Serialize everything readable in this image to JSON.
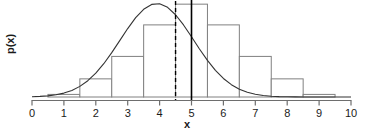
{
  "chart_data": {
    "type": "bar",
    "title": "",
    "subtitle": "",
    "xlabel": "x",
    "ylabel": "p(x)",
    "xlim": [
      0,
      10
    ],
    "ylim": [
      0,
      0.22
    ],
    "grid": false,
    "legend": null,
    "x_tick_labels": [
      "0",
      "1",
      "2",
      "3",
      "4",
      "5",
      "6",
      "7",
      "8",
      "9",
      "10"
    ],
    "x_ticks": [
      0,
      1,
      2,
      3,
      4,
      5,
      6,
      7,
      8,
      9,
      10
    ],
    "y_tick_labels": [],
    "y_ticks": [],
    "series": [
      {
        "name": "histogram",
        "type": "bar",
        "bin_edges": [
          0.5,
          1.5,
          2.5,
          3.5,
          4.5,
          5.5,
          6.5,
          7.5,
          8.5,
          9.5
        ],
        "bin_centers": [
          1,
          2,
          3,
          4,
          5,
          6,
          7,
          8,
          9
        ],
        "values": [
          0.006,
          0.042,
          0.094,
          0.167,
          0.215,
          0.167,
          0.094,
          0.042,
          0.006
        ],
        "fill": "#ffffff",
        "stroke": "#808080"
      },
      {
        "name": "normal-density-curve",
        "type": "line",
        "x": [
          0.0,
          0.25,
          0.5,
          0.75,
          1.0,
          1.25,
          1.5,
          1.75,
          2.0,
          2.25,
          2.5,
          2.75,
          3.0,
          3.25,
          3.5,
          3.75,
          4.0,
          4.25,
          4.5,
          4.75,
          5.0,
          5.25,
          5.5,
          5.75,
          6.0,
          6.25,
          6.5,
          6.75,
          7.0,
          7.25,
          7.5,
          7.75,
          8.0,
          8.25,
          8.5,
          8.75,
          9.0,
          9.25,
          9.5,
          9.75,
          10.0
        ],
        "y": [
          0.0009,
          0.0019,
          0.0037,
          0.007,
          0.0124,
          0.021,
          0.0338,
          0.0519,
          0.0759,
          0.1059,
          0.141,
          0.1792,
          0.2176,
          0.2522,
          0.279,
          0.2944,
          0.2967,
          0.2851,
          0.2616,
          0.2291,
          0.1915,
          0.1528,
          0.1165,
          0.0848,
          0.059,
          0.0392,
          0.0249,
          0.0151,
          0.0088,
          0.0049,
          0.0026,
          0.0013,
          0.0006,
          0.0003,
          0.0001,
          0.0001,
          0.0,
          0.0,
          0.0,
          0.0,
          0.0
        ],
        "stroke": "#333333",
        "distribution": "normal",
        "mean": 5,
        "sd": 1.35
      }
    ],
    "annotations": [
      {
        "name": "dashed-vertical-line",
        "type": "vline",
        "x": 4.5,
        "style": "dashed",
        "stroke": "#000000"
      },
      {
        "name": "solid-vertical-line",
        "type": "vline",
        "x": 5.0,
        "style": "solid",
        "stroke": "#000000"
      }
    ]
  },
  "figure": {
    "xlabel": "x",
    "ylabel": "p(x)",
    "tick_labels": [
      "0",
      "1",
      "2",
      "3",
      "4",
      "5",
      "6",
      "7",
      "8",
      "9",
      "10"
    ],
    "colors": {
      "background": "#ffffff",
      "axis": "#6e6e6e",
      "bar_stroke": "#8a8a8a",
      "curve": "#2b2b2b",
      "marker_line": "#000000",
      "text": "#1a1a1a"
    }
  }
}
